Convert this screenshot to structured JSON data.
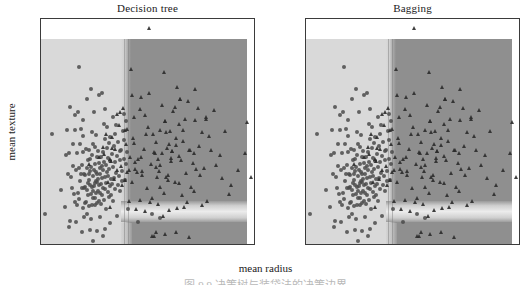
{
  "figure": {
    "xlabel": "mean radius",
    "ylabel": "mean texture",
    "clipped_caption_fragment": "图 9.9  决策树与装袋法的决策边界"
  },
  "panels": [
    {
      "title": "Decision tree",
      "name": "decision-tree"
    },
    {
      "title": "Bagging",
      "name": "bagging"
    }
  ],
  "chart_data": {
    "type": "scatter",
    "title": "",
    "panels": [
      {
        "title": "Decision tree",
        "xlabel": "mean radius",
        "ylabel": "mean texture",
        "xlim": [
          6.6,
          28.3
        ],
        "ylim": [
          9.0,
          40.5
        ],
        "xticks": [
          10,
          15,
          20,
          25
        ],
        "yticks": [
          10,
          15,
          20,
          25,
          30,
          35,
          40
        ],
        "grid": false,
        "legend": "none",
        "classes": [
          {
            "name": "class 0 (benign)",
            "marker": "circle",
            "color": "#4a4a4a"
          },
          {
            "name": "class 1 (malignant)",
            "marker": "triangle",
            "color": "#2b2b2b"
          }
        ],
        "decision_regions": [
          {
            "class": "class 0",
            "shade": "#d9d9d9",
            "x_range": [
              6.6,
              15.6
            ],
            "y_range": [
              9.0,
              38.8
            ]
          },
          {
            "class": "class 1",
            "shade": "#8f8f8f",
            "x_range": [
              15.6,
              27.6
            ],
            "y_range": [
              13.4,
              38.8
            ]
          },
          {
            "class": "class 0",
            "shade": "#ececec",
            "x_range": [
              15.6,
              27.6
            ],
            "y_range": [
              11.3,
              13.4
            ]
          },
          {
            "class": "class 1",
            "shade": "#8f8f8f",
            "x_range": [
              17.8,
              27.6
            ],
            "y_range": [
              9.0,
              11.3
            ]
          }
        ],
        "split_thresholds": {
          "mean radius": 15.6,
          "mean texture": [
            13.4,
            11.3
          ]
        }
      },
      {
        "title": "Bagging",
        "xlabel": "mean radius",
        "ylabel": "mean texture",
        "xlim": [
          6.6,
          28.3
        ],
        "ylim": [
          9.0,
          40.5
        ],
        "xticks": [
          10,
          15,
          20,
          25
        ],
        "yticks": [
          10,
          15,
          20,
          25,
          30,
          35,
          40
        ],
        "grid": false,
        "legend": "none",
        "classes": [
          {
            "name": "class 0 (benign)",
            "marker": "circle",
            "color": "#4a4a4a"
          },
          {
            "name": "class 1 (malignant)",
            "marker": "triangle",
            "color": "#2b2b2b"
          }
        ],
        "decision_regions": [
          {
            "class": "class 0",
            "shade": "#d9d9d9",
            "x_range": [
              6.6,
              15.3
            ],
            "y_range": [
              9.0,
              38.8
            ]
          },
          {
            "class": "class 1",
            "shade": "#8f8f8f",
            "x_range": [
              15.3,
              27.6
            ],
            "y_range": [
              13.4,
              38.8
            ]
          },
          {
            "class": "class 0",
            "shade": "#ececec",
            "x_range": [
              15.3,
              27.6
            ],
            "y_range": [
              11.3,
              13.4
            ]
          },
          {
            "class": "class 1",
            "shade": "#8f8f8f",
            "x_range": [
              17.6,
              27.6
            ],
            "y_range": [
              9.0,
              11.3
            ]
          }
        ],
        "split_thresholds": {
          "mean radius": 15.3,
          "mean texture": [
            13.4,
            11.3
          ]
        }
      }
    ],
    "points_class0": [
      [
        7.76,
        24.54
      ],
      [
        6.98,
        13.43
      ],
      [
        9.0,
        14.45
      ],
      [
        9.17,
        21.56
      ],
      [
        9.29,
        19.04
      ],
      [
        9.42,
        21.93
      ],
      [
        9.5,
        12.44
      ],
      [
        9.57,
        28.22
      ],
      [
        9.66,
        18.6
      ],
      [
        9.73,
        17.1
      ],
      [
        9.78,
        20.14
      ],
      [
        9.85,
        23.22
      ],
      [
        9.9,
        16.25
      ],
      [
        10.02,
        25.11
      ],
      [
        10.05,
        27.15
      ],
      [
        10.08,
        15.11
      ],
      [
        10.16,
        19.59
      ],
      [
        10.2,
        21.88
      ],
      [
        10.26,
        14.71
      ],
      [
        10.29,
        27.61
      ],
      [
        10.32,
        16.35
      ],
      [
        10.44,
        15.46
      ],
      [
        10.48,
        19.86
      ],
      [
        10.51,
        23.09
      ],
      [
        10.57,
        18.07
      ],
      [
        10.6,
        18.95
      ],
      [
        10.65,
        25.22
      ],
      [
        10.71,
        20.19
      ],
      [
        10.75,
        16.98
      ],
      [
        10.8,
        21.98
      ],
      [
        10.82,
        24.21
      ],
      [
        10.86,
        14.24
      ],
      [
        10.9,
        12.96
      ],
      [
        10.95,
        17.09
      ],
      [
        10.97,
        19.0
      ],
      [
        11.04,
        14.96
      ],
      [
        11.06,
        17.12
      ],
      [
        11.08,
        18.83
      ],
      [
        11.13,
        22.44
      ],
      [
        11.15,
        15.15
      ],
      [
        11.2,
        29.37
      ],
      [
        11.22,
        19.86
      ],
      [
        11.26,
        16.82
      ],
      [
        11.28,
        13.39
      ],
      [
        11.31,
        17.73
      ],
      [
        11.33,
        20.98
      ],
      [
        11.36,
        16.1
      ],
      [
        11.41,
        19.06
      ],
      [
        11.43,
        22.35
      ],
      [
        11.46,
        18.16
      ],
      [
        11.49,
        14.59
      ],
      [
        11.52,
        17.42
      ],
      [
        11.54,
        21.09
      ],
      [
        11.58,
        19.34
      ],
      [
        11.6,
        12.68
      ],
      [
        11.64,
        16.28
      ],
      [
        11.67,
        20.02
      ],
      [
        11.7,
        17.19
      ],
      [
        11.74,
        14.69
      ],
      [
        11.76,
        21.6
      ],
      [
        11.8,
        16.58
      ],
      [
        11.84,
        18.7
      ],
      [
        11.87,
        23.19
      ],
      [
        11.89,
        15.7
      ],
      [
        11.93,
        19.48
      ],
      [
        11.97,
        17.27
      ],
      [
        12.0,
        15.65
      ],
      [
        12.03,
        20.33
      ],
      [
        12.05,
        14.63
      ],
      [
        12.07,
        22.77
      ],
      [
        12.1,
        17.72
      ],
      [
        12.13,
        19.29
      ],
      [
        12.16,
        16.41
      ],
      [
        12.18,
        18.01
      ],
      [
        12.21,
        21.32
      ],
      [
        12.25,
        17.94
      ],
      [
        12.27,
        14.97
      ],
      [
        12.3,
        19.02
      ],
      [
        12.34,
        22.22
      ],
      [
        12.36,
        16.7
      ],
      [
        12.39,
        18.29
      ],
      [
        12.43,
        20.52
      ],
      [
        12.46,
        15.18
      ],
      [
        12.48,
        17.48
      ],
      [
        12.51,
        19.88
      ],
      [
        12.54,
        16.32
      ],
      [
        12.58,
        18.94
      ],
      [
        12.62,
        21.41
      ],
      [
        12.65,
        14.78
      ],
      [
        12.68,
        17.61
      ],
      [
        12.72,
        20.13
      ],
      [
        12.76,
        18.38
      ],
      [
        12.8,
        16.04
      ],
      [
        12.83,
        19.55
      ],
      [
        12.87,
        22.07
      ],
      [
        12.9,
        17.08
      ],
      [
        12.94,
        20.7
      ],
      [
        12.98,
        15.44
      ],
      [
        13.02,
        18.51
      ],
      [
        13.05,
        23.84
      ],
      [
        13.09,
        16.88
      ],
      [
        13.13,
        20.25
      ],
      [
        13.17,
        17.8
      ],
      [
        13.2,
        14.2
      ],
      [
        13.24,
        19.31
      ],
      [
        13.28,
        22.61
      ],
      [
        13.32,
        16.44
      ],
      [
        13.37,
        18.66
      ],
      [
        13.4,
        21.17
      ],
      [
        13.44,
        15.83
      ],
      [
        13.48,
        19.7
      ],
      [
        13.53,
        17.33
      ],
      [
        13.57,
        24.06
      ],
      [
        13.61,
        20.82
      ],
      [
        13.66,
        16.11
      ],
      [
        13.7,
        18.24
      ],
      [
        13.75,
        21.74
      ],
      [
        13.8,
        17.66
      ],
      [
        13.85,
        19.93
      ],
      [
        13.9,
        15.29
      ],
      [
        13.94,
        22.92
      ],
      [
        13.99,
        18.4
      ],
      [
        14.04,
        20.61
      ],
      [
        14.1,
        16.9
      ],
      [
        14.16,
        25.74
      ],
      [
        14.22,
        19.12
      ],
      [
        14.27,
        21.55
      ],
      [
        14.34,
        17.52
      ],
      [
        14.4,
        23.5
      ],
      [
        14.47,
        18.78
      ],
      [
        14.54,
        20.94
      ],
      [
        14.61,
        16.66
      ],
      [
        14.68,
        22.28
      ],
      [
        14.75,
        19.44
      ],
      [
        14.82,
        17.96
      ],
      [
        14.9,
        24.9
      ],
      [
        14.97,
        21.08
      ],
      [
        15.05,
        18.12
      ],
      [
        15.13,
        20.35
      ],
      [
        15.22,
        26.3
      ],
      [
        9.46,
        11.6
      ],
      [
        10.7,
        10.9
      ],
      [
        11.5,
        11.25
      ],
      [
        12.3,
        11.1
      ],
      [
        12.85,
        10.45
      ],
      [
        11.88,
        9.71
      ],
      [
        13.1,
        11.4
      ],
      [
        10.15,
        12.3
      ],
      [
        14.3,
        13.2
      ],
      [
        15.4,
        14.1
      ],
      [
        12.6,
        13.05
      ],
      [
        13.6,
        12.2
      ],
      [
        8.6,
        16.84
      ],
      [
        9.2,
        25.1
      ],
      [
        10.4,
        33.8
      ],
      [
        11.6,
        30.72
      ],
      [
        12.45,
        29.97
      ],
      [
        13.05,
        28.08
      ],
      [
        11.95,
        27.54
      ],
      [
        10.85,
        26.47
      ],
      [
        12.75,
        30.29
      ],
      [
        13.3,
        25.58
      ],
      [
        12.2,
        24.34
      ],
      [
        13.85,
        26.92
      ],
      [
        14.05,
        24.49
      ],
      [
        13.45,
        23.24
      ],
      [
        14.6,
        22.15
      ],
      [
        15.0,
        23.77
      ],
      [
        15.3,
        22.05
      ],
      [
        17.8,
        13.4
      ],
      [
        16.35,
        12.3
      ],
      [
        18.6,
        12.85
      ],
      [
        14.95,
        27.3
      ],
      [
        12.95,
        25.95
      ],
      [
        11.7,
        24.88
      ]
    ],
    "points_class1": [
      [
        17.99,
        10.38
      ],
      [
        20.57,
        17.77
      ],
      [
        19.69,
        21.25
      ],
      [
        11.42,
        20.38
      ],
      [
        20.29,
        14.34
      ],
      [
        18.25,
        19.98
      ],
      [
        13.71,
        20.83
      ],
      [
        19.81,
        22.15
      ],
      [
        13.0,
        21.82
      ],
      [
        16.02,
        23.24
      ],
      [
        15.78,
        17.89
      ],
      [
        19.17,
        24.8
      ],
      [
        15.85,
        23.95
      ],
      [
        13.73,
        22.61
      ],
      [
        14.54,
        27.54
      ],
      [
        14.68,
        20.13
      ],
      [
        16.13,
        20.68
      ],
      [
        19.81,
        22.15
      ],
      [
        13.54,
        14.36
      ],
      [
        18.61,
        20.25
      ],
      [
        16.65,
        21.38
      ],
      [
        19.59,
        25.0
      ],
      [
        15.3,
        25.27
      ],
      [
        17.57,
        15.05
      ],
      [
        18.63,
        25.11
      ],
      [
        16.84,
        19.46
      ],
      [
        20.6,
        29.33
      ],
      [
        22.01,
        21.9
      ],
      [
        21.56,
        22.39
      ],
      [
        20.13,
        28.25
      ],
      [
        16.6,
        28.08
      ],
      [
        20.6,
        29.33
      ],
      [
        17.2,
        24.52
      ],
      [
        18.08,
        21.84
      ],
      [
        21.09,
        26.57
      ],
      [
        17.46,
        39.28
      ],
      [
        15.71,
        33.55
      ],
      [
        16.07,
        19.65
      ],
      [
        19.4,
        18.18
      ],
      [
        21.37,
        15.1
      ],
      [
        22.27,
        19.67
      ],
      [
        23.29,
        26.67
      ],
      [
        24.25,
        20.2
      ],
      [
        25.22,
        24.91
      ],
      [
        27.22,
        21.87
      ],
      [
        20.18,
        23.97
      ],
      [
        19.21,
        18.57
      ],
      [
        18.45,
        21.07
      ],
      [
        17.08,
        27.15
      ],
      [
        16.78,
        18.8
      ],
      [
        20.94,
        23.56
      ],
      [
        19.55,
        23.21
      ],
      [
        21.61,
        22.28
      ],
      [
        18.31,
        18.58
      ],
      [
        22.53,
        22.88
      ],
      [
        17.42,
        25.56
      ],
      [
        19.07,
        26.28
      ],
      [
        20.26,
        23.03
      ],
      [
        18.82,
        21.97
      ],
      [
        23.51,
        24.27
      ],
      [
        21.71,
        17.25
      ],
      [
        20.48,
        21.46
      ],
      [
        22.44,
        28.14
      ],
      [
        19.44,
        18.82
      ],
      [
        18.66,
        17.12
      ],
      [
        24.63,
        21.6
      ],
      [
        23.09,
        19.83
      ],
      [
        20.73,
        20.88
      ],
      [
        17.93,
        24.48
      ],
      [
        22.1,
        26.52
      ],
      [
        19.1,
        26.29
      ],
      [
        21.28,
        19.18
      ],
      [
        18.49,
        19.47
      ],
      [
        20.09,
        17.92
      ],
      [
        23.21,
        26.97
      ],
      [
        25.73,
        17.46
      ],
      [
        27.42,
        26.27
      ],
      [
        26.49,
        19.56
      ],
      [
        24.11,
        27.86
      ],
      [
        22.84,
        24.84
      ],
      [
        20.55,
        25.96
      ],
      [
        19.68,
        20.77
      ],
      [
        18.22,
        23.43
      ],
      [
        17.68,
        20.42
      ],
      [
        21.95,
        20.55
      ],
      [
        23.71,
        22.33
      ],
      [
        20.92,
        25.09
      ],
      [
        19.34,
        22.61
      ],
      [
        18.05,
        22.06
      ],
      [
        22.62,
        18.83
      ],
      [
        17.3,
        17.08
      ],
      [
        16.95,
        22.45
      ],
      [
        16.44,
        21.12
      ],
      [
        16.25,
        19.31
      ],
      [
        15.95,
        26.85
      ],
      [
        18.77,
        28.62
      ],
      [
        19.89,
        27.74
      ],
      [
        21.45,
        29.08
      ],
      [
        17.55,
        30.18
      ],
      [
        20.36,
        31.01
      ],
      [
        18.97,
        33.12
      ],
      [
        16.74,
        29.7
      ],
      [
        22.15,
        30.85
      ],
      [
        19.02,
        16.4
      ],
      [
        20.8,
        16.12
      ],
      [
        17.85,
        15.62
      ],
      [
        22.05,
        16.7
      ],
      [
        18.4,
        14.85
      ],
      [
        24.9,
        18.5
      ],
      [
        27.8,
        18.55
      ],
      [
        17.85,
        10.42
      ],
      [
        20.2,
        11.0
      ],
      [
        19.1,
        10.6
      ],
      [
        21.5,
        10.25
      ],
      [
        18.2,
        10.95
      ],
      [
        15.46,
        19.48
      ],
      [
        15.3,
        19.2
      ],
      [
        15.62,
        21.3
      ],
      [
        15.2,
        23.1
      ],
      [
        15.05,
        25.1
      ],
      [
        14.9,
        28.12
      ],
      [
        14.25,
        27.3
      ],
      [
        15.75,
        29.9
      ],
      [
        13.8,
        24.1
      ],
      [
        14.1,
        22.5
      ],
      [
        13.6,
        21.05
      ],
      [
        12.9,
        22.8
      ],
      [
        13.2,
        24.6
      ],
      [
        12.5,
        21.4
      ],
      [
        14.45,
        25.8
      ],
      [
        15.1,
        18.12
      ],
      [
        14.75,
        17.4
      ],
      [
        14.3,
        19.6
      ],
      [
        13.95,
        18.3
      ],
      [
        13.4,
        17.9
      ],
      [
        15.5,
        15.2
      ],
      [
        16.2,
        14.1
      ],
      [
        17.1,
        13.9
      ],
      [
        18.9,
        13.1
      ],
      [
        16.6,
        15.4
      ],
      [
        19.5,
        14.0
      ],
      [
        21.0,
        14.4
      ],
      [
        23.4,
        15.3
      ],
      [
        25.6,
        16.2
      ],
      [
        22.8,
        14.7
      ]
    ]
  }
}
